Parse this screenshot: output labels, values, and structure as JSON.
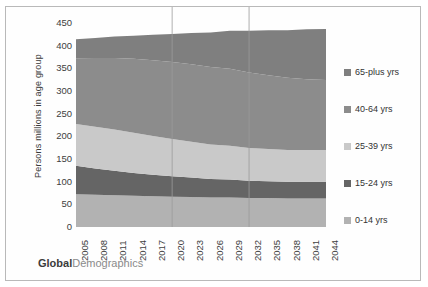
{
  "watermark": {
    "bold": "Global",
    "rest": "Demographics"
  },
  "axes": {
    "ylabel": "Persons millions in age group",
    "yticks": [
      0,
      50,
      100,
      150,
      200,
      250,
      300,
      350,
      400,
      450
    ],
    "xticks": [
      2005,
      2008,
      2011,
      2014,
      2017,
      2020,
      2023,
      2026,
      2029,
      2032,
      2035,
      2038,
      2041,
      2044
    ]
  },
  "legend": {
    "items": [
      {
        "label": "65-plus yrs",
        "color": "#7f7f7f"
      },
      {
        "label": "40-64 yrs",
        "color": "#8c8c8c"
      },
      {
        "label": "25-39 yrs",
        "color": "#c9c9c9"
      },
      {
        "label": "15-24 yrs",
        "color": "#656565"
      },
      {
        "label": "0-14 yrs",
        "color": "#b2b2b2"
      }
    ]
  },
  "chart_data": {
    "type": "area",
    "title": "",
    "xlabel": "",
    "ylabel": "Persons millions in age group",
    "ylim": [
      0,
      450
    ],
    "grid": "vertical-sparse",
    "legend_position": "right",
    "stacked": true,
    "x": [
      2005,
      2008,
      2011,
      2014,
      2017,
      2020,
      2023,
      2026,
      2029,
      2032,
      2035,
      2038,
      2041,
      2044
    ],
    "series": [
      {
        "name": "0-14 yrs",
        "color": "#b2b2b2",
        "values": [
          72,
          71,
          70,
          69,
          68,
          67,
          66,
          65,
          65,
          64,
          64,
          63,
          63,
          63
        ]
      },
      {
        "name": "15-24 yrs",
        "color": "#656565",
        "values": [
          63,
          58,
          54,
          50,
          47,
          45,
          43,
          41,
          40,
          38,
          37,
          37,
          37,
          37
        ]
      },
      {
        "name": "25-39 yrs",
        "color": "#c9c9c9",
        "values": [
          92,
          92,
          91,
          89,
          86,
          82,
          79,
          76,
          74,
          72,
          71,
          70,
          70,
          70
        ]
      },
      {
        "name": "40-64 yrs",
        "color": "#8c8c8c",
        "values": [
          145,
          152,
          158,
          163,
          167,
          170,
          171,
          171,
          170,
          167,
          163,
          159,
          156,
          154
        ]
      },
      {
        "name": "65-plus yrs",
        "color": "#7f7f7f",
        "values": [
          42,
          44,
          47,
          51,
          56,
          62,
          69,
          76,
          84,
          92,
          99,
          105,
          110,
          113
        ]
      }
    ],
    "totals": [
      414,
      417,
      420,
      422,
      424,
      426,
      428,
      429,
      423,
      413,
      404,
      394,
      386,
      385
    ],
    "gridline_years": [
      2020,
      2032
    ]
  }
}
